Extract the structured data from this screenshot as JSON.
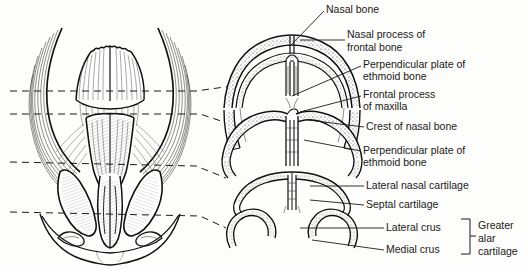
{
  "figure": {
    "background_color": "#fdfdfb",
    "ink_color": "#111111"
  },
  "labels": [
    {
      "id": "nasal-bone",
      "text": "Nasal bone",
      "x": 326,
      "y": 5,
      "lines": [
        "Nasal bone"
      ]
    },
    {
      "id": "nasal-process-frontal",
      "text": "Nasal process of frontal bone",
      "x": 347,
      "y": 30,
      "lines": [
        "Nasal process of",
        "frontal bone"
      ]
    },
    {
      "id": "perpendicular-plate-1",
      "text": "Perpendicular plate of ethmoid bone",
      "x": 363,
      "y": 60,
      "lines": [
        "Perpendicular plate of",
        "ethmoid bone"
      ]
    },
    {
      "id": "frontal-process-maxilla",
      "text": "Frontal process of maxilla",
      "x": 363,
      "y": 90,
      "lines": [
        "Frontal process",
        "of maxilla"
      ]
    },
    {
      "id": "crest-nasal-bone",
      "text": "Crest of nasal bone",
      "x": 366,
      "y": 122,
      "lines": [
        "Crest of nasal bone"
      ]
    },
    {
      "id": "perpendicular-plate-2",
      "text": "Perpendicular plate of ethmoid bone",
      "x": 363,
      "y": 146,
      "lines": [
        "Perpendicular plate of",
        "ethmoid bone"
      ]
    },
    {
      "id": "lateral-nasal-cartilage",
      "text": "Lateral nasal cartilage",
      "x": 366,
      "y": 181,
      "lines": [
        "Lateral nasal cartilage"
      ]
    },
    {
      "id": "septal-cartilage",
      "text": "Septal cartilage",
      "x": 366,
      "y": 200,
      "lines": [
        "Septal cartilage"
      ]
    },
    {
      "id": "lateral-crus",
      "text": "Lateral crus",
      "x": 386,
      "y": 223,
      "lines": [
        "Lateral crus"
      ]
    },
    {
      "id": "medial-crus",
      "text": "Medial crus",
      "x": 386,
      "y": 245,
      "lines": [
        "Medial crus"
      ]
    },
    {
      "id": "greater-alar-cartilage",
      "text": "Greater alar cartilage",
      "x": 478,
      "y": 221,
      "lines": [
        "Greater",
        "alar",
        "cartilage"
      ]
    }
  ],
  "sections": [
    {
      "id": "section-1",
      "name": "upper-bony-vault-cross-section"
    },
    {
      "id": "section-2",
      "name": "lower-bony-vault-cross-section"
    },
    {
      "id": "section-3",
      "name": "lateral-nasal-cartilage-cross-section"
    },
    {
      "id": "section-4",
      "name": "alar-cartilage-cross-section"
    }
  ],
  "section_lines": [
    {
      "id": "section-line-1",
      "y_left": 91,
      "y_right": 86
    },
    {
      "id": "section-line-2",
      "y_left": 114,
      "y_right": 122
    },
    {
      "id": "section-line-3",
      "y_left": 162,
      "y_right": 178
    },
    {
      "id": "section-line-4",
      "y_left": 212,
      "y_right": 228
    }
  ]
}
